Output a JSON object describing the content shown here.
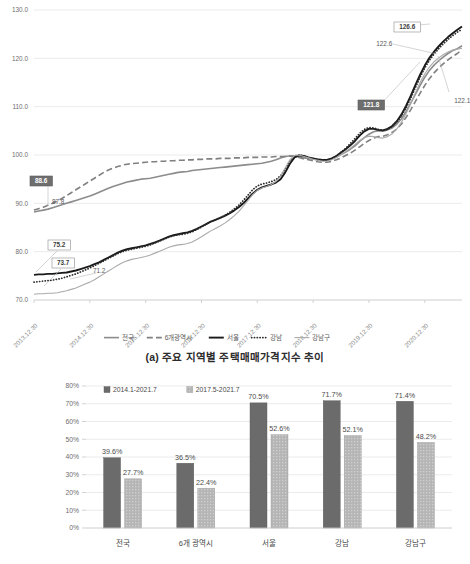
{
  "figure": {
    "caption_a": "(a) 주요 지역별 주택매매가격지수 추이"
  },
  "chart_data": [
    {
      "id": "line-chart",
      "type": "line",
      "title": "(a) 주요 지역별 주택매매가격지수 추이",
      "xlabel": "",
      "ylabel": "",
      "ylim": [
        70.0,
        130.0
      ],
      "yticks": [
        "70.0",
        "80.0",
        "90.0",
        "100.0",
        "110.0",
        "120.0",
        "130.0"
      ],
      "ytick_values": [
        70.0,
        80.0,
        90.0,
        100.0,
        110.0,
        120.0,
        130.0
      ],
      "grid": true,
      "legend_position": "bottom",
      "xticks": [
        "2013.12.30",
        "2014.12.30",
        "2015.12.30",
        "2016.12.30",
        "2017.12.30",
        "2018.12.30",
        "2019.12.30",
        "2020.12.30"
      ],
      "xtick_positions": [
        0,
        12,
        24,
        36,
        48,
        60,
        72,
        84
      ],
      "x_count": 93,
      "series": [
        {
          "name": "전국",
          "style": "solid",
          "color": "#8c8c8c",
          "width": 1.6,
          "values": [
            88.2,
            88.4,
            88.6,
            88.8,
            89.1,
            89.4,
            89.7,
            90.0,
            90.3,
            90.6,
            90.9,
            91.2,
            91.5,
            91.9,
            92.3,
            92.7,
            93.1,
            93.5,
            93.8,
            94.1,
            94.4,
            94.6,
            94.8,
            95.0,
            95.1,
            95.2,
            95.4,
            95.6,
            95.8,
            96.0,
            96.2,
            96.4,
            96.5,
            96.6,
            96.8,
            96.9,
            97.0,
            97.1,
            97.2,
            97.3,
            97.4,
            97.5,
            97.6,
            97.7,
            97.8,
            97.9,
            98.0,
            98.1,
            98.2,
            98.3,
            98.5,
            98.7,
            99.0,
            99.4,
            99.7,
            99.8,
            99.8,
            99.6,
            99.4,
            99.3,
            99.2,
            99.1,
            99.0,
            99.0,
            99.2,
            99.6,
            100.1,
            100.6,
            101.2,
            101.9,
            102.8,
            103.6,
            104.3,
            104.8,
            105.0,
            104.9,
            105.2,
            105.6,
            106.4,
            107.5,
            109.0,
            110.8,
            112.6,
            114.4,
            116.1,
            117.5,
            118.6,
            119.5,
            120.3,
            121.0,
            121.6,
            122.0,
            122.6
          ],
          "end_label": "122.6",
          "start_label": "88.6"
        },
        {
          "name": "6개광역시",
          "style": "dashed",
          "color": "#808080",
          "width": 1.6,
          "values": [
            88.6,
            88.9,
            89.2,
            89.6,
            90.0,
            90.5,
            91.0,
            91.6,
            92.2,
            92.8,
            93.4,
            94.0,
            94.6,
            95.2,
            95.8,
            96.4,
            96.9,
            97.3,
            97.6,
            97.9,
            98.1,
            98.2,
            98.3,
            98.4,
            98.5,
            98.6,
            98.6,
            98.7,
            98.7,
            98.8,
            98.8,
            98.9,
            98.9,
            99.0,
            99.0,
            99.1,
            99.1,
            99.2,
            99.2,
            99.2,
            99.3,
            99.3,
            99.3,
            99.4,
            99.4,
            99.4,
            99.5,
            99.5,
            99.5,
            99.6,
            99.6,
            99.6,
            99.7,
            99.7,
            99.7,
            99.8,
            99.7,
            99.5,
            99.2,
            99.0,
            98.8,
            98.6,
            98.5,
            98.5,
            98.7,
            99.0,
            99.4,
            99.9,
            100.4,
            101.0,
            101.7,
            102.4,
            103.0,
            103.5,
            103.8,
            103.9,
            104.2,
            104.7,
            105.4,
            106.4,
            107.8,
            109.4,
            111.1,
            112.8,
            114.4,
            115.8,
            117.0,
            118.0,
            118.9,
            119.7,
            120.4,
            121.0,
            121.8
          ],
          "end_label": "121.8",
          "start_label": "87.8"
        },
        {
          "name": "서울",
          "style": "solid",
          "color": "#1a1a1a",
          "width": 1.9,
          "values": [
            75.2,
            75.3,
            75.3,
            75.4,
            75.4,
            75.5,
            75.6,
            75.7,
            75.9,
            76.1,
            76.4,
            76.7,
            77.0,
            77.4,
            77.8,
            78.3,
            78.8,
            79.3,
            79.8,
            80.2,
            80.5,
            80.7,
            80.9,
            81.1,
            81.3,
            81.6,
            81.9,
            82.3,
            82.7,
            83.1,
            83.4,
            83.6,
            83.8,
            84.0,
            84.3,
            84.7,
            85.2,
            85.7,
            86.2,
            86.6,
            87.0,
            87.4,
            87.9,
            88.5,
            89.2,
            90.0,
            91.0,
            92.0,
            92.8,
            93.3,
            93.6,
            93.9,
            94.3,
            95.0,
            96.4,
            98.2,
            99.5,
            99.9,
            99.8,
            99.5,
            99.3,
            99.1,
            99.0,
            99.0,
            99.3,
            99.8,
            100.5,
            101.2,
            102.0,
            102.9,
            104.0,
            104.9,
            105.4,
            105.4,
            105.2,
            105.1,
            105.4,
            106.0,
            107.0,
            108.4,
            110.2,
            112.3,
            114.5,
            116.6,
            118.5,
            120.1,
            121.4,
            122.5,
            123.5,
            124.4,
            125.2,
            125.9,
            126.6
          ],
          "end_label": "126.6",
          "start_label": "75.2"
        },
        {
          "name": "강남",
          "style": "dotted",
          "color": "#2b2b2b",
          "width": 1.7,
          "values": [
            73.7,
            73.8,
            73.9,
            74.0,
            74.1,
            74.3,
            74.5,
            74.8,
            75.1,
            75.4,
            75.8,
            76.2,
            76.6,
            77.1,
            77.6,
            78.1,
            78.6,
            79.1,
            79.6,
            80.0,
            80.3,
            80.5,
            80.7,
            80.9,
            81.1,
            81.4,
            81.8,
            82.2,
            82.6,
            83.0,
            83.3,
            83.5,
            83.6,
            83.8,
            84.1,
            84.6,
            85.1,
            85.7,
            86.2,
            86.6,
            87.0,
            87.5,
            88.1,
            88.8,
            89.6,
            90.6,
            91.7,
            92.8,
            93.6,
            94.0,
            94.2,
            94.5,
            94.9,
            95.7,
            97.1,
            98.8,
            99.8,
            100.0,
            99.8,
            99.5,
            99.2,
            99.0,
            98.9,
            98.9,
            99.2,
            99.8,
            100.6,
            101.4,
            102.4,
            103.4,
            104.5,
            105.3,
            105.7,
            105.6,
            105.3,
            105.1,
            105.3,
            105.9,
            106.8,
            108.1,
            109.8,
            111.8,
            114.0,
            116.1,
            118.0,
            119.6,
            120.9,
            122.0,
            123.0,
            123.9,
            124.7,
            125.4,
            126.0
          ],
          "end_label": "",
          "start_label": "73.7"
        },
        {
          "name": "강남구",
          "style": "solid-thin",
          "color": "#aaaaaa",
          "width": 1.1,
          "values": [
            71.2,
            71.3,
            71.3,
            71.4,
            71.4,
            71.5,
            71.7,
            71.9,
            72.2,
            72.5,
            72.9,
            73.3,
            73.7,
            74.2,
            74.8,
            75.4,
            76.0,
            76.6,
            77.2,
            77.7,
            78.1,
            78.4,
            78.6,
            78.8,
            79.0,
            79.3,
            79.7,
            80.1,
            80.5,
            80.9,
            81.2,
            81.4,
            81.5,
            81.7,
            82.0,
            82.5,
            83.1,
            83.7,
            84.3,
            84.8,
            85.3,
            85.9,
            86.6,
            87.4,
            88.3,
            89.4,
            90.6,
            91.8,
            92.7,
            93.2,
            93.5,
            93.9,
            94.5,
            95.6,
            97.3,
            99.0,
            99.9,
            100.0,
            99.7,
            99.4,
            99.1,
            98.9,
            98.7,
            98.7,
            99.0,
            99.5,
            100.1,
            100.7,
            101.4,
            102.2,
            103.0,
            103.6,
            103.9,
            103.8,
            103.6,
            103.5,
            103.8,
            104.4,
            105.4,
            106.8,
            108.6,
            110.7,
            112.9,
            115.0,
            116.8,
            118.2,
            119.3,
            120.1,
            120.8,
            121.3,
            121.7,
            121.9,
            122.1
          ],
          "end_label": "122.1",
          "start_label": "71.2"
        }
      ],
      "callouts": [
        {
          "text": "88.6",
          "box": "dark",
          "x": 30,
          "y": 176
        },
        {
          "text": "87.8",
          "box": "none",
          "x": 47,
          "y": 197
        },
        {
          "text": "75.2",
          "box": "light",
          "x": 48,
          "y": 240
        },
        {
          "text": "73.7",
          "box": "light",
          "x": 52,
          "y": 258
        },
        {
          "text": "71.2",
          "box": "none",
          "x": 88,
          "y": 266
        },
        {
          "text": "126.6",
          "box": "light",
          "x": 394,
          "y": 22
        },
        {
          "text": "122.6",
          "box": "none",
          "x": 371,
          "y": 39
        },
        {
          "text": "121.8",
          "box": "dark",
          "x": 358,
          "y": 100
        },
        {
          "text": "122.1",
          "box": "none",
          "x": 449,
          "y": 96
        }
      ]
    },
    {
      "id": "bar-chart",
      "type": "bar",
      "title": "",
      "xlabel": "",
      "ylabel": "",
      "ylim": [
        0,
        80
      ],
      "yticks": [
        "0%",
        "10%",
        "20%",
        "30%",
        "40%",
        "50%",
        "60%",
        "70%",
        "80%"
      ],
      "ytick_values": [
        0,
        10,
        20,
        30,
        40,
        50,
        60,
        70,
        80
      ],
      "grid": true,
      "legend_position": "top-left",
      "categories": [
        "전국",
        "6개 광역시",
        "서울",
        "강남",
        "강남구"
      ],
      "series": [
        {
          "name": "2014.1-2021.7",
          "color": "#6b6b6b",
          "values": [
            39.6,
            36.5,
            70.5,
            71.7,
            71.4
          ],
          "labels": [
            "39.6%",
            "36.5%",
            "70.5%",
            "71.7%",
            "71.4%"
          ]
        },
        {
          "name": "2017.5-2021.7",
          "color": "#b5b5b5",
          "values": [
            27.7,
            22.4,
            52.6,
            52.1,
            48.2
          ],
          "labels": [
            "27.7%",
            "22.4%",
            "52.6%",
            "52.1%",
            "48.2%"
          ]
        }
      ]
    }
  ]
}
